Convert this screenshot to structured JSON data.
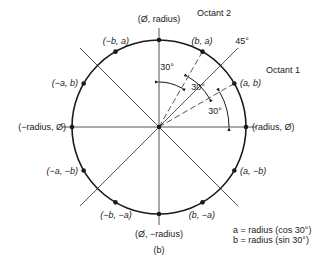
{
  "figure": {
    "caption": "(b)",
    "center": [
      159,
      127
    ],
    "radius": 87,
    "colors": {
      "ink": "#1a1a1a",
      "line": "#555555",
      "bg": "#ffffff"
    },
    "axes": {
      "horizontal": [
        62,
        256
      ],
      "vertical": [
        28,
        225
      ]
    },
    "diagonals": {
      "extent": 79
    },
    "dashed_rays_deg": [
      30,
      60
    ],
    "points": [
      {
        "angle": 90,
        "label": "(Ø, radius)",
        "lx": 159,
        "ly": 22,
        "anchor": "middle"
      },
      {
        "angle": 60,
        "label": "(b, a)",
        "lx": 202,
        "ly": 44,
        "anchor": "middle",
        "italic": true
      },
      {
        "angle": 30,
        "label": "(a, b)",
        "lx": 240,
        "ly": 86,
        "anchor": "start",
        "italic": true
      },
      {
        "angle": 0,
        "label": "(radius, Ø)",
        "lx": 252,
        "ly": 130,
        "anchor": "start"
      },
      {
        "angle": -30,
        "label": "(a, −b)",
        "lx": 240,
        "ly": 174,
        "anchor": "start",
        "italic": true
      },
      {
        "angle": -60,
        "label": "(b, −a)",
        "lx": 202,
        "ly": 218,
        "anchor": "middle",
        "italic": true
      },
      {
        "angle": -90,
        "label": "(Ø, −radius)",
        "lx": 159,
        "ly": 237,
        "anchor": "middle"
      },
      {
        "angle": -120,
        "label": "(−b, −a)",
        "lx": 116,
        "ly": 218,
        "anchor": "middle",
        "italic": true
      },
      {
        "angle": -150,
        "label": "(−a, −b)",
        "lx": 78,
        "ly": 174,
        "anchor": "end",
        "italic": true
      },
      {
        "angle": 180,
        "label": "(−radius, Ø)",
        "lx": 66,
        "ly": 130,
        "anchor": "end"
      },
      {
        "angle": 150,
        "label": "(−a, b)",
        "lx": 78,
        "ly": 86,
        "anchor": "end",
        "italic": true
      },
      {
        "angle": 120,
        "label": "(−b, a)",
        "lx": 116,
        "ly": 44,
        "anchor": "middle",
        "italic": true
      }
    ],
    "angle_arcs": [
      {
        "r": 70,
        "from": 0,
        "to": 30,
        "label": "30°",
        "lx": 215,
        "ly": 114
      },
      {
        "r": 58,
        "from": 30,
        "to": 60,
        "label": "30°",
        "lx": 198,
        "ly": 90
      },
      {
        "r": 45,
        "from": 60,
        "to": 90,
        "label": "30°",
        "lx": 167,
        "ly": 70
      }
    ],
    "labels": {
      "octant1": {
        "text": "Octant 1",
        "x": 283,
        "y": 73
      },
      "octant2": {
        "text": "Octant 2",
        "x": 214,
        "y": 16
      },
      "deg45": {
        "text": "45°",
        "x": 242,
        "y": 44
      },
      "caption": {
        "text": "(b)",
        "x": 159,
        "y": 253
      }
    },
    "legend": {
      "line1": "a = radius (cos 30°)",
      "line2": "b = radius (sin 30°)",
      "x": 233,
      "y1": 233,
      "y2": 243
    }
  }
}
